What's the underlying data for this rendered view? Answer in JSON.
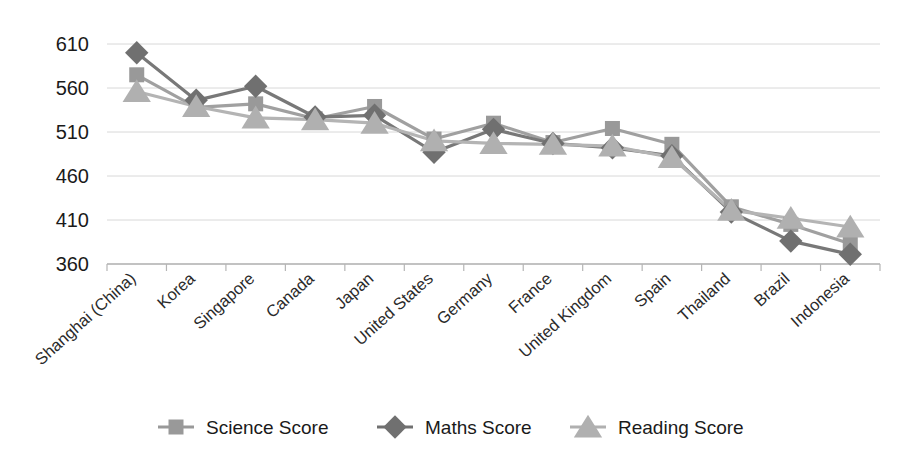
{
  "figure": {
    "clipped_top_text": "",
    "background_color": "#ffffff"
  },
  "chart_data": {
    "type": "line",
    "title": "",
    "subtitle": "",
    "xlabel": "",
    "ylabel": "",
    "ylim": [
      360,
      620
    ],
    "yticks": [
      360,
      410,
      460,
      510,
      560,
      610
    ],
    "grid": true,
    "legend_position": "bottom",
    "categories": [
      "Shanghai (China)",
      "Korea",
      "Singapore",
      "Canada",
      "Japan",
      "United States",
      "Germany",
      "France",
      "United Kingdom",
      "Spain",
      "Thailand",
      "Brazil",
      "Indonesia"
    ],
    "series": [
      {
        "name": "Science Score",
        "marker": "square",
        "color": "#999999",
        "line_color": "#a0a0a0",
        "values": [
          575,
          538,
          542,
          525,
          539,
          502,
          520,
          498,
          514,
          496,
          425,
          405,
          383
        ]
      },
      {
        "name": "Maths Score",
        "marker": "diamond",
        "color": "#707070",
        "line_color": "#787878",
        "values": [
          600,
          546,
          562,
          527,
          529,
          487,
          513,
          497,
          492,
          483,
          419,
          386,
          371
        ]
      },
      {
        "name": "Reading Score",
        "marker": "triangle",
        "color": "#b0b0b0",
        "line_color": "#b4b4b4",
        "values": [
          556,
          539,
          526,
          524,
          520,
          500,
          497,
          496,
          494,
          481,
          421,
          412,
          402
        ]
      }
    ]
  },
  "legend": {
    "items": [
      {
        "label": "Science Score",
        "marker": "square-marker",
        "color": "#999999"
      },
      {
        "label": "Maths Score",
        "marker": "diamond-marker",
        "color": "#707070"
      },
      {
        "label": "Reading Score",
        "marker": "triangle-marker",
        "color": "#b0b0b0"
      }
    ]
  },
  "axes": {
    "y_tick_labels": [
      "610",
      "560",
      "510",
      "460",
      "410",
      "360"
    ],
    "x_tick_labels": [
      "Shanghai (China)",
      "Korea",
      "Singapore",
      "Canada",
      "Japan",
      "United States",
      "Germany",
      "France",
      "United Kingdom",
      "Spain",
      "Thailand",
      "Brazil",
      "Indonesia"
    ]
  }
}
